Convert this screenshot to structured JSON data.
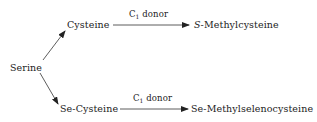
{
  "diagram": {
    "source": {
      "label": "Serine"
    },
    "top_branch": {
      "intermediate": "Cysteine",
      "reagent": {
        "prefix": "C",
        "subscript": "1",
        "suffix": " donor"
      },
      "product": {
        "prefix": "S",
        "suffix": "-Methylcysteine"
      }
    },
    "bottom_branch": {
      "intermediate": "Se-Cysteine",
      "reagent": {
        "prefix": "C",
        "subscript": "1",
        "suffix": " donor"
      },
      "product": "Se-Methylselenocysteine"
    },
    "colors": {
      "line": "#333333",
      "text": "#222222",
      "background": "#ffffff"
    }
  }
}
